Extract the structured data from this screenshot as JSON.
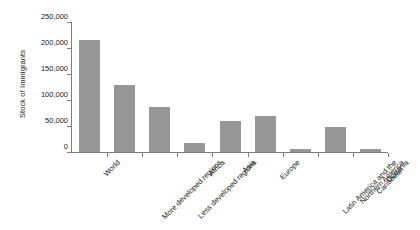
{
  "chart_data": {
    "type": "bar",
    "title": "",
    "xlabel": "",
    "ylabel": "Stock of Immigrants",
    "ylim": [
      0,
      250000
    ],
    "ytick_labels": [
      "250,000",
      "200,000",
      "150,000",
      "100,000",
      "50,000",
      "0"
    ],
    "ytick_values": [
      250000,
      200000,
      150000,
      100000,
      50000,
      0
    ],
    "grid": false,
    "legend": "none",
    "bar_color": "#969696",
    "axis_color": "#7d7d7d",
    "categories": [
      "World",
      "More developed regions",
      "Less developed regions",
      "Africa",
      "Asia",
      "Europe",
      "Latin America and the Caribbean",
      "Northern America",
      "Oceania"
    ],
    "values": [
      215000,
      128000,
      87000,
      18000,
      60000,
      70000,
      5000,
      48000,
      5000
    ]
  }
}
